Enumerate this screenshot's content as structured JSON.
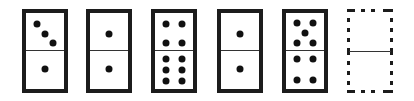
{
  "puzzle": {
    "dominoes": [
      {
        "id": 1,
        "style": "solid",
        "left": 22,
        "top_value": 3,
        "bottom_value": 1
      },
      {
        "id": 2,
        "style": "solid",
        "left": 86,
        "top_value": 1,
        "bottom_value": 1
      },
      {
        "id": 3,
        "style": "solid",
        "left": 151,
        "top_value": 4,
        "bottom_value": 6
      },
      {
        "id": 4,
        "style": "solid",
        "left": 217,
        "top_value": 1,
        "bottom_value": 1
      },
      {
        "id": 5,
        "style": "solid",
        "left": 282,
        "top_value": 5,
        "bottom_value": 4
      },
      {
        "id": 6,
        "style": "dashed",
        "left": 347,
        "top_value": null,
        "bottom_value": null
      }
    ],
    "colors": {
      "border": "#1c1c1c",
      "pip": "#111111",
      "background": "#ffffff"
    }
  }
}
